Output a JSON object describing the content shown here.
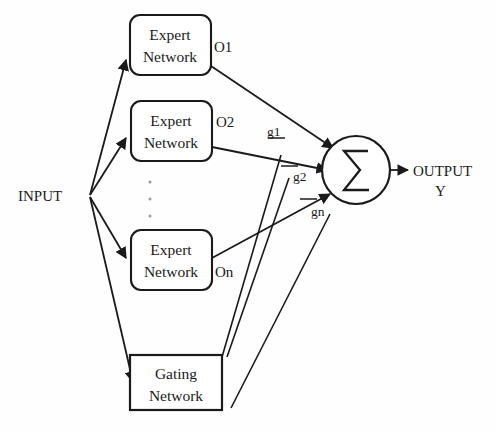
{
  "diagram": {
    "background_color": "#fefefe",
    "stroke_color": "#1a1a1a",
    "input": {
      "label": "INPUT"
    },
    "output": {
      "label_line1": "OUTPUT",
      "label_line2": "Y"
    },
    "sum_node": {
      "symbol": "Σ",
      "name": "summation-node"
    },
    "experts": [
      {
        "line1": "Expert",
        "line2": "Network",
        "output_label": "O1"
      },
      {
        "line1": "Expert",
        "line2": "Network",
        "output_label": "O2"
      },
      {
        "line1": "Expert",
        "line2": "Network",
        "output_label": "On"
      }
    ],
    "gating": {
      "line1": "Gating",
      "line2": "Network"
    },
    "gate_weights": [
      {
        "label": "g1"
      },
      {
        "label": "g2"
      },
      {
        "label": "gn"
      }
    ],
    "ellipsis": "⋮"
  }
}
